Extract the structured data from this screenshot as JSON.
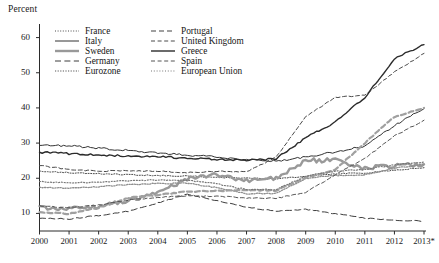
{
  "chart_data": {
    "type": "line",
    "title": "",
    "ylabel": "Percent",
    "xlabel": "",
    "ylim": [
      5,
      65
    ],
    "yticks": [
      10,
      20,
      30,
      40,
      50,
      60
    ],
    "xlim": [
      2000,
      2013
    ],
    "x": [
      2000,
      2001,
      2002,
      2003,
      2004,
      2005,
      2006,
      2007,
      2008,
      2009,
      2010,
      2011,
      2012,
      2013
    ],
    "xticklabels": [
      "2000",
      "2001",
      "2002",
      "2003",
      "2004",
      "2005",
      "2006",
      "2007",
      "2008",
      "2009",
      "2010",
      "2011",
      "2012",
      "2013*"
    ],
    "grid": false,
    "legend_position": "upper-center",
    "note": "2013* denotes provisional / partial-year data",
    "series": [
      {
        "name": "France",
        "style": "fine-dotted",
        "color": "#4a4a4a",
        "width": 1.0,
        "values": [
          22.0,
          21.6,
          21.3,
          21.0,
          20.8,
          20.6,
          20.3,
          20.0,
          19.8,
          20.6,
          21.3,
          21.5,
          22.3,
          23.0
        ]
      },
      {
        "name": "Italy",
        "style": "solid-thin",
        "color": "#333333",
        "width": 1.0,
        "values": [
          29.5,
          29.2,
          28.6,
          27.9,
          27.2,
          26.6,
          26.0,
          25.3,
          24.8,
          26.0,
          27.5,
          29.1,
          35.0,
          39.8
        ]
      },
      {
        "name": "Sweden",
        "style": "solid-thick-gray",
        "color": "#999999",
        "width": 2.4,
        "values": [
          11.5,
          11.2,
          12.0,
          13.6,
          16.0,
          19.8,
          21.0,
          19.3,
          20.0,
          25.0,
          25.2,
          22.8,
          23.6,
          24.0
        ]
      },
      {
        "name": "Germany",
        "style": "long-dash",
        "color": "#3d3d3d",
        "width": 1.0,
        "values": [
          8.7,
          8.4,
          9.4,
          10.6,
          13.0,
          15.5,
          13.6,
          11.8,
          10.6,
          11.2,
          9.9,
          8.6,
          8.1,
          7.8
        ]
      },
      {
        "name": "Eurozone",
        "style": "dotted-light",
        "color": "#8e8e8e",
        "width": 1.3,
        "values": [
          17.4,
          17.2,
          17.6,
          18.2,
          18.5,
          18.6,
          17.3,
          15.6,
          15.7,
          20.0,
          20.8,
          21.0,
          22.8,
          24.0
        ]
      },
      {
        "name": "Portugal",
        "style": "thick-dash-gray",
        "color": "#a0a0a0",
        "width": 2.2,
        "values": [
          10.4,
          9.9,
          11.6,
          14.4,
          15.3,
          16.2,
          16.4,
          16.7,
          16.5,
          20.1,
          22.5,
          30.0,
          37.5,
          40.0
        ]
      },
      {
        "name": "United Kingdom",
        "style": "dash",
        "color": "#4a4a4a",
        "width": 1.0,
        "values": [
          23.6,
          22.5,
          22.0,
          22.2,
          22.0,
          21.6,
          22.0,
          21.8,
          26.0,
          37.5,
          43.0,
          43.6,
          50.2,
          55.5
        ]
      },
      {
        "name": "Greece",
        "style": "solid-thick",
        "color": "#2b2b2b",
        "width": 1.4,
        "values": [
          27.4,
          27.0,
          26.6,
          26.3,
          26.1,
          25.7,
          25.4,
          25.0,
          25.6,
          31.5,
          36.0,
          43.0,
          54.0,
          58.0
        ]
      },
      {
        "name": "Spain",
        "style": "dash",
        "color": "#555555",
        "width": 1.0,
        "values": [
          12.1,
          11.6,
          12.4,
          13.8,
          14.6,
          15.0,
          14.9,
          14.4,
          14.3,
          16.0,
          21.0,
          25.6,
          32.0,
          36.5
        ]
      },
      {
        "name": "European Union",
        "style": "dotted",
        "color": "#777777",
        "width": 1.2,
        "values": [
          19.0,
          18.7,
          18.9,
          19.3,
          19.5,
          19.4,
          18.4,
          16.8,
          16.8,
          20.6,
          22.0,
          22.5,
          23.8,
          24.6
        ]
      }
    ]
  },
  "legend": {
    "left_column": [
      "France",
      "Italy",
      "Sweden",
      "Germany",
      "Eurozone"
    ],
    "right_column": [
      "Portugal",
      "United Kingdom",
      "Greece",
      "Spain",
      "European Union"
    ]
  },
  "colors": {
    "axis": "#2b2b2b",
    "text": "#1a1a1a",
    "background": "#ffffff"
  }
}
